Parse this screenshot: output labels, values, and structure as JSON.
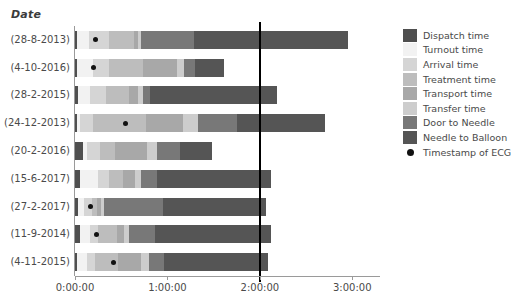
{
  "axis_title": "Date",
  "legend": {
    "entries": [
      {
        "label": "Dispatch time",
        "color": "#4f4f4f"
      },
      {
        "label": "Turnout time",
        "color": "#f2f2f2"
      },
      {
        "label": "Arrival time",
        "color": "#d5d5d5"
      },
      {
        "label": "Treatment time",
        "color": "#bdbdbd"
      },
      {
        "label": "Transport time",
        "color": "#a8a8a8"
      },
      {
        "label": "Transfer time",
        "color": "#cdcdcd"
      },
      {
        "label": "Door to Needle",
        "color": "#787878"
      },
      {
        "label": "Needle to Balloon",
        "color": "#555555"
      }
    ],
    "marker": {
      "label": "Timestamp of ECG",
      "color": "#111111"
    }
  },
  "chart_data": {
    "type": "bar",
    "orientation": "horizontal",
    "stacked": true,
    "title": "",
    "xlabel": "",
    "ylabel": "Date",
    "grid": false,
    "legend_position": "right",
    "xlim": [
      0,
      11880
    ],
    "x_unit": "seconds",
    "xtick_labels": [
      "0:00:00",
      "1:00:00",
      "2:00:00",
      "3:00:00"
    ],
    "xtick_values": [
      0,
      3600,
      7200,
      10800
    ],
    "reference_line": {
      "label": "2:00:00",
      "value": 7200
    },
    "series": [
      {
        "name": "Dispatch time",
        "color": "#4f4f4f",
        "values": [
          60,
          60,
          120,
          60,
          300,
          180,
          120,
          180,
          60
        ]
      },
      {
        "name": "Turnout time",
        "color": "#f2f2f2",
        "values": [
          480,
          660,
          480,
          120,
          180,
          720,
          240,
          420,
          420
        ]
      },
      {
        "name": "Arrival time",
        "color": "#d5d5d5",
        "values": [
          780,
          600,
          600,
          540,
          480,
          420,
          300,
          300,
          300
        ]
      },
      {
        "name": "Treatment time",
        "color": "#bdbdbd",
        "values": [
          960,
          1320,
          900,
          2040,
          600,
          540,
          180,
          720,
          900
        ]
      },
      {
        "name": "Transport time",
        "color": "#a8a8a8",
        "values": [
          180,
          1320,
          360,
          1440,
          1260,
          480,
          180,
          300,
          900
        ]
      },
      {
        "name": "Transfer time",
        "color": "#cdcdcd",
        "values": [
          120,
          300,
          180,
          600,
          360,
          240,
          120,
          180,
          300
        ]
      },
      {
        "name": "Door to Needle",
        "color": "#787878",
        "values": [
          2040,
          420,
          300,
          1500,
          900,
          600,
          2280,
          1020,
          600
        ]
      },
      {
        "name": "Needle to Balloon",
        "color": "#555555",
        "values": [
          6000,
          1140,
          4920,
          3420,
          1260,
          4440,
          4020,
          4500,
          4020
        ]
      }
    ],
    "categories": [
      "(28-8-2013)",
      "(4-10-2016)",
      "(28-2-2015)",
      "(24-12-2013)",
      "(20-2-2016)",
      "(15-6-2017)",
      "(27-2-2017)",
      "(11-9-2014)",
      "(4-11-2015)"
    ],
    "ecg_timestamps": [
      780,
      720,
      null,
      1980,
      null,
      null,
      600,
      840,
      1500
    ]
  }
}
